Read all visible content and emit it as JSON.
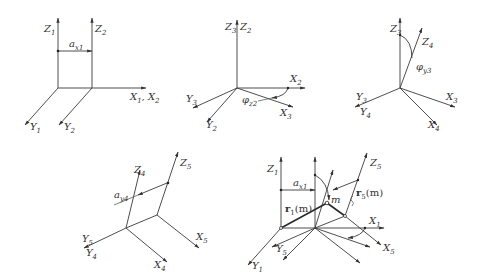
{
  "figure": {
    "panels": [
      {
        "id": "translation-x",
        "labels": {
          "z1": "Z",
          "z1s": "1",
          "z2": "Z",
          "z2s": "2",
          "a": "a",
          "as": "x1",
          "x": "X",
          "xs1": "1",
          "xsep": ", ",
          "x2": "X",
          "xs2": "2",
          "y1": "Y",
          "y1s": "1",
          "y2": "Y",
          "y2s": "2"
        }
      },
      {
        "id": "rotation-z",
        "labels": {
          "z3": "Z",
          "z3s": "3",
          "z2": "Z",
          "z2s": "2",
          "x2": "X",
          "x2s": "2",
          "x3": "X",
          "x3s": "3",
          "y3": "Y",
          "y3s": "3",
          "y2": "Y",
          "y2s": "2",
          "phi": "φ",
          "phis": "z2"
        }
      },
      {
        "id": "rotation-y",
        "labels": {
          "z3": "Z",
          "z3s": "3",
          "z4": "Z",
          "z4s": "4",
          "x3": "X",
          "x3s": "3",
          "x4": "X",
          "x4s": "4",
          "y3": "Y",
          "y3s": "3",
          "y4": "Y",
          "y4s": "4",
          "phi": "φ",
          "phis": "y3"
        }
      },
      {
        "id": "translation-y",
        "labels": {
          "z4": "Z",
          "z4s": "4",
          "z5": "Z",
          "z5s": "5",
          "a": "a",
          "as": "y4",
          "x5": "X",
          "x5s": "5",
          "x4": "X",
          "x4s": "4",
          "y5": "Y",
          "y5s": "5",
          "y4": "Y",
          "y4s": "4"
        }
      },
      {
        "id": "combined",
        "labels": {
          "z1": "Z",
          "z1s": "1",
          "z5": "Z",
          "z5s": "5",
          "a": "a",
          "as": "x1",
          "r1": "r",
          "r1s": "1",
          "r1arg": "(m)",
          "r5": "r",
          "r5s": "5",
          "r5arg": "(m)",
          "m": "m",
          "x1": "X",
          "x1s": "1",
          "x5": "X",
          "x5s": "5",
          "y1": "Y",
          "y1s": "1",
          "y5": "Y",
          "y5s": "5"
        }
      }
    ]
  }
}
